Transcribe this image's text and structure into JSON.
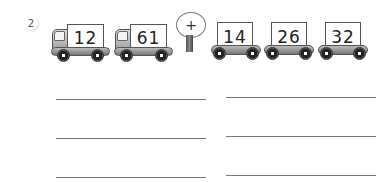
{
  "question_number": "2",
  "trucks": [
    {
      "value": "12",
      "type": "truck"
    },
    {
      "value": "61",
      "type": "truck"
    }
  ],
  "operator": {
    "symbol": "+",
    "icon": "tree-icon"
  },
  "cars": [
    {
      "value": "14",
      "type": "car"
    },
    {
      "value": "26",
      "type": "car"
    },
    {
      "value": "32",
      "type": "car"
    }
  ],
  "answer_lines": {
    "count": 6,
    "columns": 2,
    "rows": 3
  }
}
